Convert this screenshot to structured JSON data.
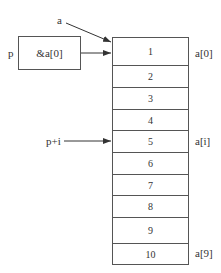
{
  "diagram": {
    "array_name_label": "a",
    "pointer": {
      "name": "p",
      "value": "&a[0]"
    },
    "offset_pointer_label": "p+i",
    "cells": [
      "1",
      "2",
      "3",
      "4",
      "5",
      "6",
      "7",
      "8",
      "9",
      "10"
    ],
    "index_labels": {
      "first": "a[0]",
      "middle": "a[i]",
      "last": "a[9]"
    }
  }
}
